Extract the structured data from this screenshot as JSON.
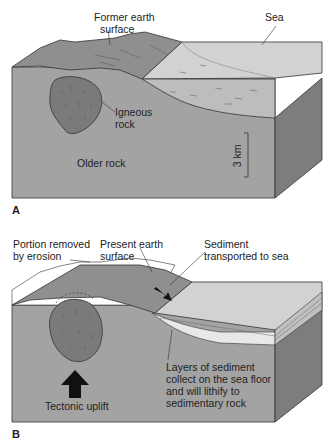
{
  "panel_a": {
    "letter": "A",
    "labels": {
      "former_surface_1": "Former earth",
      "former_surface_2": "surface",
      "sea": "Sea",
      "igneous_1": "Igneous",
      "igneous_2": "rock",
      "older_rock": "Older rock",
      "scale": "3 km"
    }
  },
  "panel_b": {
    "letter": "B",
    "labels": {
      "portion_1": "Portion removed",
      "portion_2": "by erosion",
      "present_1": "Present earth",
      "present_2": "surface",
      "sediment_1": "Sediment",
      "sediment_2": "transported to sea",
      "layers_1": "Layers of sediment",
      "layers_2": "collect on the sea floor",
      "layers_3": "and will lithify to",
      "layers_4": "sedimentary rock",
      "uplift": "Tectonic uplift"
    }
  },
  "colors": {
    "rock_front": "#a3a3a3",
    "rock_side": "#7d7d7d",
    "land_top": "#8f8f8f",
    "sea_top": "#d2d2d2",
    "sea_water": "#bdbdbd",
    "igneous": "#7a7a7a",
    "outline": "#333333"
  }
}
